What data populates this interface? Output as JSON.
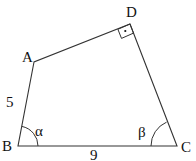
{
  "diagram": {
    "type": "quadrilateral",
    "stroke_color": "#333333",
    "vertices": {
      "A": {
        "label": "A",
        "x": 34,
        "y": 62
      },
      "B": {
        "label": "B",
        "x": 18,
        "y": 146
      },
      "C": {
        "label": "C",
        "x": 177,
        "y": 146
      },
      "D": {
        "label": "D",
        "x": 130,
        "y": 24
      }
    },
    "sides": {
      "AB": {
        "label": "5"
      },
      "BC": {
        "label": "9"
      }
    },
    "angles": {
      "B": {
        "label": "α"
      },
      "C": {
        "label": "β"
      },
      "D": {
        "label": "right-angle",
        "marker": "·"
      }
    }
  }
}
